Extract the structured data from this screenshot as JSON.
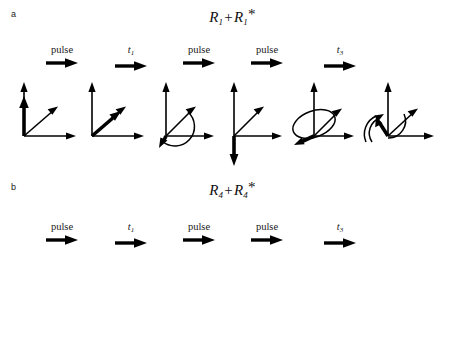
{
  "figure": {
    "background": "#ffffff",
    "stroke_color": "#000000",
    "width": 465,
    "height": 346
  },
  "panels": [
    {
      "letter": "a",
      "title_main": "R",
      "title_sub": "1",
      "title_plus": "+",
      "title_star": "*",
      "title_text": "R1+R1*",
      "steps": [
        {
          "label": "pulse",
          "italic": false,
          "sub": "",
          "icon": "right-arrow-icon",
          "x": 62
        },
        {
          "label": "t",
          "italic": true,
          "sub": "1",
          "icon": "right-arrow-icon",
          "x": 131
        },
        {
          "label": "pulse",
          "italic": false,
          "sub": "",
          "icon": "right-arrow-icon",
          "x": 199
        },
        {
          "label": "pulse",
          "italic": false,
          "sub": "",
          "icon": "right-arrow-icon",
          "x": 267
        },
        {
          "label": "t",
          "italic": true,
          "sub": "3",
          "icon": "right-arrow-icon",
          "x": 340
        }
      ],
      "frames": [
        {
          "name": "equilibrium-magnetization",
          "vector": "up",
          "arc": "none",
          "x": 12
        },
        {
          "name": "tilted-magnetization",
          "vector": "diagonal",
          "arc": "none",
          "x": 80
        },
        {
          "name": "precessing-magnetization-small-arc",
          "vector": "down-left",
          "arc": "small",
          "x": 150
        },
        {
          "name": "inverted-magnetization",
          "vector": "down",
          "arc": "none",
          "x": 218
        },
        {
          "name": "precessing-magnetization-ellipse",
          "vector": "down-left-long",
          "arc": "ellipse-left",
          "x": 288
        },
        {
          "name": "refocused-magnetization-curved-arrows",
          "vector": "up-left",
          "arc": "curved-arrows",
          "x": 358
        }
      ]
    },
    {
      "letter": "b",
      "title_main": "R",
      "title_sub": "4",
      "title_plus": "+",
      "title_star": "*",
      "title_text": "R4+R4*",
      "steps": [
        {
          "label": "pulse",
          "italic": false,
          "sub": "",
          "icon": "right-arrow-icon",
          "x": 62
        },
        {
          "label": "t",
          "italic": true,
          "sub": "1",
          "icon": "right-arrow-icon",
          "x": 131
        },
        {
          "label": "pulse",
          "italic": false,
          "sub": "",
          "icon": "right-arrow-icon",
          "x": 199
        },
        {
          "label": "pulse",
          "italic": false,
          "sub": "",
          "icon": "right-arrow-icon",
          "x": 267
        },
        {
          "label": "t",
          "italic": true,
          "sub": "3",
          "icon": "right-arrow-icon",
          "x": 340
        }
      ],
      "frames": [
        {
          "name": "equilibrium-magnetization",
          "vector": "up",
          "arc": "none",
          "x": 12
        },
        {
          "name": "tilted-magnetization",
          "vector": "diagonal",
          "arc": "none",
          "x": 80
        },
        {
          "name": "precessing-magnetization-wide-arc",
          "vector": "down-left",
          "arc": "wide",
          "x": 150
        },
        {
          "name": "inverted-magnetization",
          "vector": "down",
          "arc": "none",
          "x": 218
        },
        {
          "name": "precessing-magnetization-arc",
          "vector": "down-left-short",
          "arc": "wide",
          "x": 288
        },
        {
          "name": "refocused-magnetization-ellipse",
          "vector": "left",
          "arc": "ellipse-below",
          "x": 358
        }
      ]
    }
  ]
}
